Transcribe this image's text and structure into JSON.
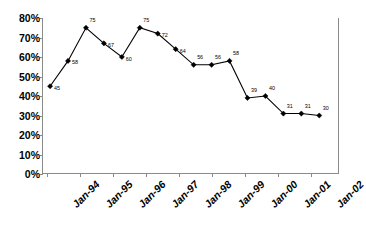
{
  "chart_data": {
    "type": "line",
    "title": "",
    "subtitle": "",
    "xlabel": "",
    "ylabel": "",
    "ylim": [
      0,
      80
    ],
    "ytick_step": 10,
    "ytick_labels": [
      "80%",
      "70%",
      "60%",
      "50%",
      "40%",
      "30%",
      "20%",
      "10%",
      "0%"
    ],
    "ytick_values": [
      80,
      70,
      60,
      50,
      40,
      30,
      20,
      10,
      0
    ],
    "xtick_labels": [
      "Jan-94",
      "Jan-95",
      "Jan-96",
      "Jan-97",
      "Jan-98",
      "Jan-99",
      "Jan-00",
      "Jan-01",
      "Jan-02"
    ],
    "grid": false,
    "legend": "none",
    "marker": "diamond",
    "line_color": "#000000",
    "marker_color": "#000000",
    "axis_color": "#8a8a8a",
    "background": "#ffffff",
    "show_data_labels": true,
    "x": [
      0,
      1,
      2,
      3,
      4,
      5,
      6,
      7,
      8,
      9,
      10,
      11,
      12,
      13,
      14,
      15
    ],
    "values": [
      45,
      58,
      75,
      67,
      60,
      75,
      72,
      64,
      56,
      56,
      58,
      39,
      40,
      31,
      31,
      30
    ],
    "point_labels": [
      "45",
      "58",
      "75",
      "67",
      "60",
      "75",
      "72",
      "64",
      "56",
      "56",
      "58",
      "39",
      "40",
      "31",
      "31",
      "30"
    ],
    "series": [
      {
        "name": "Series 1",
        "values": [
          45,
          58,
          75,
          67,
          60,
          75,
          72,
          64,
          56,
          56,
          58,
          39,
          40,
          31,
          31,
          30
        ]
      }
    ]
  }
}
